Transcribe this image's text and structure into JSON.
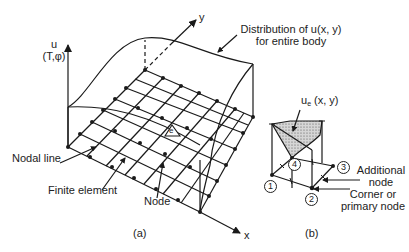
{
  "figure_a": {
    "caption": "(a)",
    "axis_u_label_line1": "u",
    "axis_u_label_line2": "(T,φ)",
    "axis_x_label": "x",
    "axis_y_label": "y",
    "distribution_label_line1": "Distribution of u(x, y)",
    "distribution_label_line2": "for entire body",
    "nodal_line_label": "Nodal line",
    "finite_element_label": "Finite element",
    "node_label": "Node",
    "element_marker": "e"
  },
  "figure_b": {
    "caption": "(b)",
    "ue_label_main": "u",
    "ue_label_sub": "e",
    "ue_label_args": " (x, y)",
    "node_numbers": [
      "1",
      "2",
      "3",
      "4"
    ],
    "additional_node_line1": "Additional",
    "additional_node_line2": "node",
    "corner_node_line1": "Corner or",
    "corner_node_line2": "primary node"
  },
  "colors": {
    "line": "#1a1a1a",
    "background": "#ffffff",
    "shading": "#bdbdbd"
  }
}
